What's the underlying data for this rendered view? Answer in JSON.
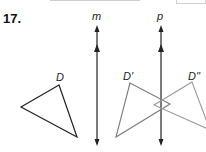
{
  "problem": {
    "number": "17."
  },
  "figure": {
    "lines": [
      {
        "label": "m",
        "x": 97
      },
      {
        "label": "p",
        "x": 161
      }
    ],
    "triangles": [
      {
        "label": "D",
        "color": "#222222"
      },
      {
        "label": "D'",
        "color": "#7a7a7a"
      },
      {
        "label": "D''",
        "color": "#9a9a9a"
      }
    ]
  }
}
